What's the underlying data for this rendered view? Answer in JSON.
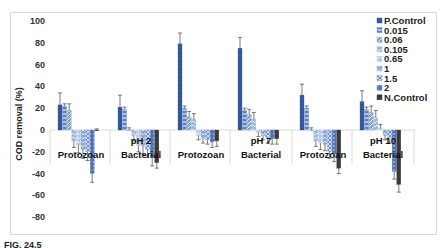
{
  "caption": "FIG. 24.5",
  "chart_data": {
    "type": "bar",
    "title": "",
    "xlabel": "",
    "ylabel": "COD removal (%)",
    "ylim": [
      -80,
      100
    ],
    "yticks": [
      100,
      80,
      60,
      40,
      20,
      0,
      -20,
      -40,
      -60,
      -80
    ],
    "grid": false,
    "legend_position": "right-top",
    "categories": [
      "Protozoan",
      "Bacterial",
      "Protozoan",
      "Bacterial",
      "Protozoan",
      "Bacterial"
    ],
    "category_groups": [
      {
        "label": "pH 2",
        "categories": [
          "Protozoan",
          "Bacterial"
        ]
      },
      {
        "label": "pH 7",
        "categories": [
          "Protozoan",
          "Bacterial"
        ]
      },
      {
        "label": "pH 10",
        "categories": [
          "Protozoan",
          "Bacterial"
        ]
      }
    ],
    "series": [
      {
        "name": "P.Control",
        "color": "#2f5597",
        "pattern": "solid",
        "values": [
          23,
          21,
          79,
          75,
          32,
          26
        ],
        "errors": [
          11,
          11,
          10,
          10,
          10,
          10
        ]
      },
      {
        "name": "0.015",
        "color": "#5b7fbf",
        "pattern": "hlines",
        "values": [
          22,
          19,
          20,
          18,
          20,
          19
        ],
        "errors": [
          2,
          2,
          2,
          2,
          2,
          2
        ]
      },
      {
        "name": "0.06",
        "color": "#7f9fd3",
        "pattern": "diag",
        "values": [
          18,
          0,
          12,
          14,
          0,
          16
        ],
        "errors": [
          6,
          2,
          5,
          5,
          2,
          6
        ]
      },
      {
        "name": "0.105",
        "color": "#9db5df",
        "pattern": "wave",
        "values": [
          -10,
          -5,
          10,
          10,
          -10,
          12
        ],
        "errors": [
          6,
          5,
          5,
          6,
          5,
          6
        ]
      },
      {
        "name": "0.65",
        "color": "#aec3e6",
        "pattern": "plus",
        "values": [
          -14,
          -14,
          -5,
          -2,
          -12,
          2
        ],
        "errors": [
          7,
          6,
          4,
          4,
          6,
          3
        ]
      },
      {
        "name": "1",
        "color": "#8aa7d8",
        "pattern": "wave2",
        "values": [
          -18,
          -15,
          -8,
          -5,
          -13,
          -5
        ],
        "errors": [
          8,
          7,
          4,
          4,
          6,
          4
        ]
      },
      {
        "name": "1.5",
        "color": "#6d8fcb",
        "pattern": "cross",
        "values": [
          -20,
          -18,
          -9,
          -7,
          -20,
          -8
        ],
        "errors": [
          8,
          7,
          4,
          5,
          6,
          4
        ]
      },
      {
        "name": "2",
        "color": "#4f73b5",
        "pattern": "dots",
        "values": [
          -40,
          -25,
          -11,
          -8,
          -22,
          -38
        ],
        "errors": [
          8,
          8,
          5,
          5,
          7,
          7
        ]
      },
      {
        "name": "N.Control",
        "color": "#3a3a3a",
        "pattern": "solid",
        "values": [
          0,
          -30,
          -10,
          -8,
          -35,
          -50
        ],
        "errors": [
          1,
          5,
          5,
          5,
          5,
          7
        ]
      }
    ]
  }
}
